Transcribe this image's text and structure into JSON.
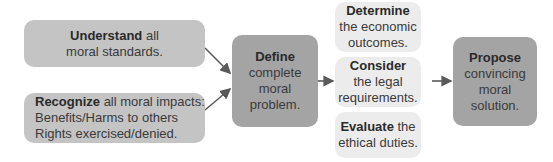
{
  "diagram": {
    "type": "flowchart",
    "nodes": {
      "understand": {
        "bold": "Understand",
        "rest": " all",
        "line2": "moral standards."
      },
      "recognize": {
        "bold": "Recognize",
        "rest": " all moral impacts:",
        "line2": "Benefits/Harms to others",
        "line3": "Rights exercised/denied."
      },
      "define": {
        "bold": "Define",
        "line2": "complete",
        "line3": "moral",
        "line4": "problem."
      },
      "determine": {
        "bold": "Determine",
        "line2": "the economic",
        "line3": "outcomes."
      },
      "consider": {
        "bold": "Consider",
        "line2": "the legal",
        "line3": "requirements."
      },
      "evaluate": {
        "bold": "Evaluate",
        "rest": " the",
        "line2": "ethical duties."
      },
      "propose": {
        "bold": "Propose",
        "line2": "convincing",
        "line3": "moral",
        "line4": "solution."
      }
    },
    "edges": [
      [
        "understand",
        "define"
      ],
      [
        "recognize",
        "define"
      ],
      [
        "define",
        "consider"
      ],
      [
        "consider",
        "propose"
      ]
    ],
    "colors": {
      "dark": "#a4a4a4",
      "mid": "#c4c4c4",
      "light": "#ececec",
      "arrow": "#5a5a5a"
    }
  }
}
